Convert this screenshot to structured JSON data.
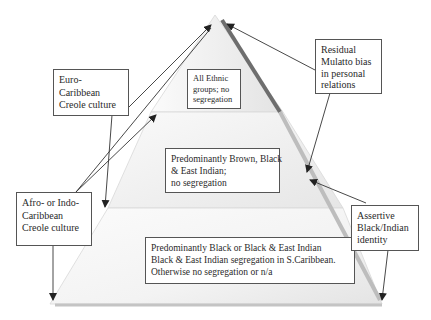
{
  "diagram": {
    "type": "pyramid",
    "tiers": [
      {
        "level": "top",
        "label_lines": [
          "All Ethnic",
          "groups; no",
          "segregation"
        ]
      },
      {
        "level": "middle",
        "label_lines": [
          "Predominantly Brown, Black",
          "& East Indian;",
          "no segregation"
        ]
      },
      {
        "level": "bottom",
        "label_lines": [
          "Predominantly Black or Black & East Indian",
          "Black & East Indian segregation in S.Caribbean.",
          "Otherwise no segregation or n/a"
        ]
      }
    ],
    "left_annotations": [
      {
        "id": "euro",
        "label_lines": [
          "Euro-",
          "Caribbean",
          "Creole culture"
        ]
      },
      {
        "id": "afro",
        "label_lines": [
          "Afro- or Indo-",
          "Caribbean",
          "Creole culture"
        ]
      }
    ],
    "right_annotations": [
      {
        "id": "mulatto",
        "label_lines": [
          "Residual",
          "Mulatto bias",
          "in personal",
          "relations"
        ]
      },
      {
        "id": "assertive",
        "label_lines": [
          "Assertive",
          "Black/Indian",
          "identity"
        ]
      }
    ],
    "colors": {
      "tier_fill_light": "#f7f7f7",
      "tier_fill_dark": "#e2e2e2",
      "right_edge_dark": "#6e6e6e",
      "right_edge_light": "#bdbdbd",
      "arrow": "#333333"
    }
  }
}
